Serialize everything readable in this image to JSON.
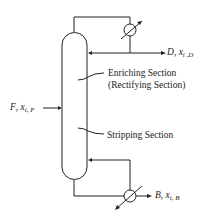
{
  "diagram": {
    "labels": {
      "enriching": "Enriching Section",
      "rectifying": "(Rectifying Section)",
      "stripping": "Stripping Section"
    },
    "streams": {
      "feed": {
        "symbol": "F",
        "comp": "x",
        "sub": "i, F"
      },
      "distillate": {
        "symbol": "D",
        "comp": "x",
        "sub": "i ,D"
      },
      "bottoms": {
        "symbol": "B",
        "comp": "x",
        "sub": "i, B"
      }
    },
    "components": [
      "column",
      "condenser",
      "reboiler"
    ],
    "colors": {
      "line": "#222222",
      "background": "#ffffff"
    }
  }
}
